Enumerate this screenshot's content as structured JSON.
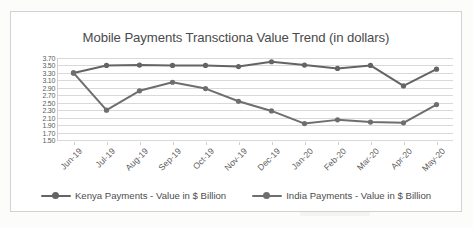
{
  "chart_data": {
    "type": "line",
    "title": "Mobile Payments Transctiona Value Trend (in dollars)",
    "xlabel": "",
    "ylabel": "",
    "ylim": [
      1.5,
      3.7
    ],
    "ytick_step": 0.2,
    "grid": true,
    "legend_position": "bottom",
    "categories": [
      "Jun-19",
      "Jul-19",
      "Aug-19",
      "Sep-19",
      "Oct-19",
      "Nov-19",
      "Dec-19",
      "Jan-20",
      "Feb-20",
      "Mar-20",
      "Apr-20",
      "May-20"
    ],
    "ytick_labels": [
      "3.70",
      "3.50",
      "3.30",
      "3.10",
      "2.90",
      "2.70",
      "2.50",
      "2.30",
      "2.10",
      "1.90",
      "1.70",
      "1.50"
    ],
    "series": [
      {
        "name": "Kenya Payments - Value in $ Billion",
        "color": "#646464",
        "marker": "circle",
        "values": [
          3.3,
          3.5,
          3.51,
          3.5,
          3.5,
          3.47,
          3.6,
          3.51,
          3.42,
          3.5,
          2.95,
          3.4
        ]
      },
      {
        "name": "India Payments - Value in $ Billion",
        "color": "#6e6e6e",
        "marker": "circle",
        "values": [
          3.3,
          2.3,
          2.82,
          3.05,
          2.88,
          2.54,
          2.28,
          1.94,
          2.04,
          1.98,
          1.96,
          2.45
        ]
      }
    ]
  },
  "legend": {
    "items": [
      {
        "label": "Kenya Payments - Value in $ Billion",
        "color": "#646464"
      },
      {
        "label": "India Payments - Value in $ Billion",
        "color": "#6e6e6e"
      }
    ]
  },
  "colors": {
    "series_kenya": "#646464",
    "series_india": "#6e6e6e",
    "gridline": "#d9d9d9",
    "frame_border": "#d2d2d2",
    "text": "#4a4a4a",
    "background": "#ffffff"
  }
}
